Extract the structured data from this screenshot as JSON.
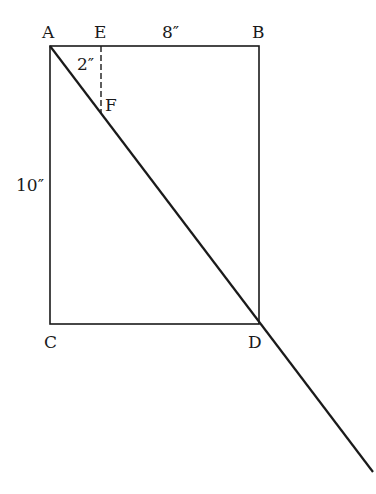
{
  "diagram": {
    "points": {
      "A": {
        "label": "A",
        "x": 50,
        "y": 46
      },
      "E": {
        "label": "E",
        "x": 101,
        "y": 46
      },
      "B": {
        "label": "B",
        "x": 259,
        "y": 46
      },
      "F": {
        "label": "F",
        "x": 101,
        "y": 114
      },
      "C": {
        "label": "C",
        "x": 50,
        "y": 324
      },
      "D": {
        "label": "D",
        "x": 259,
        "y": 324
      }
    },
    "measurements": {
      "top_side": "8″",
      "left_side": "10″",
      "ef_segment": "2″"
    },
    "stroke_color": "#1a1a1a"
  }
}
